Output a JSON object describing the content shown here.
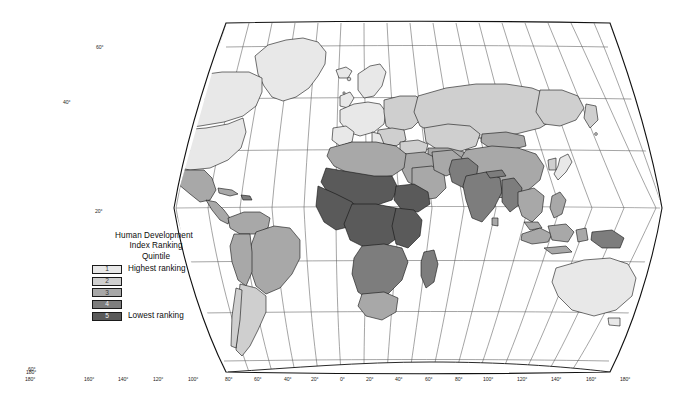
{
  "figure": {
    "projection": "Robinson",
    "background": "#ffffff",
    "border_color": "#111111",
    "graticule_color": "#4f4f4f",
    "country_outline_color": "#111111"
  },
  "legend": {
    "title_line1": "Human Development",
    "title_line2": "Index Ranking",
    "subtitle": "Quintile",
    "classes": [
      {
        "rank": "1",
        "label": "Highest ranking",
        "color": "#e8e8e8"
      },
      {
        "rank": "2",
        "label": "",
        "color": "#cfcfcf"
      },
      {
        "rank": "3",
        "label": "",
        "color": "#a8a8a8"
      },
      {
        "rank": "4",
        "label": "",
        "color": "#7d7d7d"
      },
      {
        "rank": "5",
        "label": "Lowest ranking",
        "color": "#5a5a5a"
      }
    ]
  },
  "graticule": {
    "longitude_labels_left": [
      "180°",
      "160°",
      "140°",
      "120°",
      "100°",
      "80°",
      "60°",
      "40°",
      "20°"
    ],
    "longitude_labels_right": [
      "0°",
      "20°",
      "40°",
      "60°",
      "80°",
      "100°",
      "120°",
      "140°",
      "160°",
      "180°"
    ],
    "latitude_labels_left": [
      "60°",
      "40°",
      "20°",
      "0°",
      "20°",
      "40°",
      "60°"
    ],
    "bottom_corner_left": "180°",
    "bottom_corner_left_upper": "160°",
    "bottom_axis": [
      {
        "text": "180°",
        "x": 36,
        "y": 378
      },
      {
        "text": "160°",
        "x": 85,
        "y": 378
      },
      {
        "text": "140°",
        "x": 118,
        "y": 378
      },
      {
        "text": "120°",
        "x": 153,
        "y": 378
      },
      {
        "text": "100°",
        "x": 188,
        "y": 378
      },
      {
        "text": "80°",
        "x": 224,
        "y": 378
      },
      {
        "text": "60°",
        "x": 253,
        "y": 378
      },
      {
        "text": "40°",
        "x": 283,
        "y": 378
      },
      {
        "text": "20°",
        "x": 310,
        "y": 378
      },
      {
        "text": "0°",
        "x": 339,
        "y": 378
      },
      {
        "text": "20°",
        "x": 366,
        "y": 378
      },
      {
        "text": "40°",
        "x": 395,
        "y": 378
      },
      {
        "text": "60°",
        "x": 425,
        "y": 378
      },
      {
        "text": "80°",
        "x": 455,
        "y": 378
      },
      {
        "text": "100°",
        "x": 484,
        "y": 378
      },
      {
        "text": "120°",
        "x": 518,
        "y": 378
      },
      {
        "text": "140°",
        "x": 552,
        "y": 378
      },
      {
        "text": "160°",
        "x": 587,
        "y": 378
      },
      {
        "text": "180°",
        "x": 621,
        "y": 378
      }
    ],
    "left_axis": [
      {
        "text": "60°",
        "x": 60,
        "y": 52
      },
      {
        "text": "40°",
        "x": 43,
        "y": 103
      },
      {
        "text": "20°",
        "x": 35,
        "y": 152
      },
      {
        "text": "0°",
        "x": 32,
        "y": 204
      },
      {
        "text": "20°",
        "x": 36,
        "y": 256
      },
      {
        "text": "40°",
        "x": 44,
        "y": 306
      },
      {
        "text": "60°",
        "x": 62,
        "y": 364
      }
    ],
    "left_inner": [
      {
        "text": "60°",
        "x": 94,
        "y": 49
      },
      {
        "text": "40°",
        "x": 64,
        "y": 102
      },
      {
        "text": "20°",
        "x": 96,
        "y": 212
      },
      {
        "text": "60°",
        "x": 36,
        "y": 366
      }
    ]
  }
}
